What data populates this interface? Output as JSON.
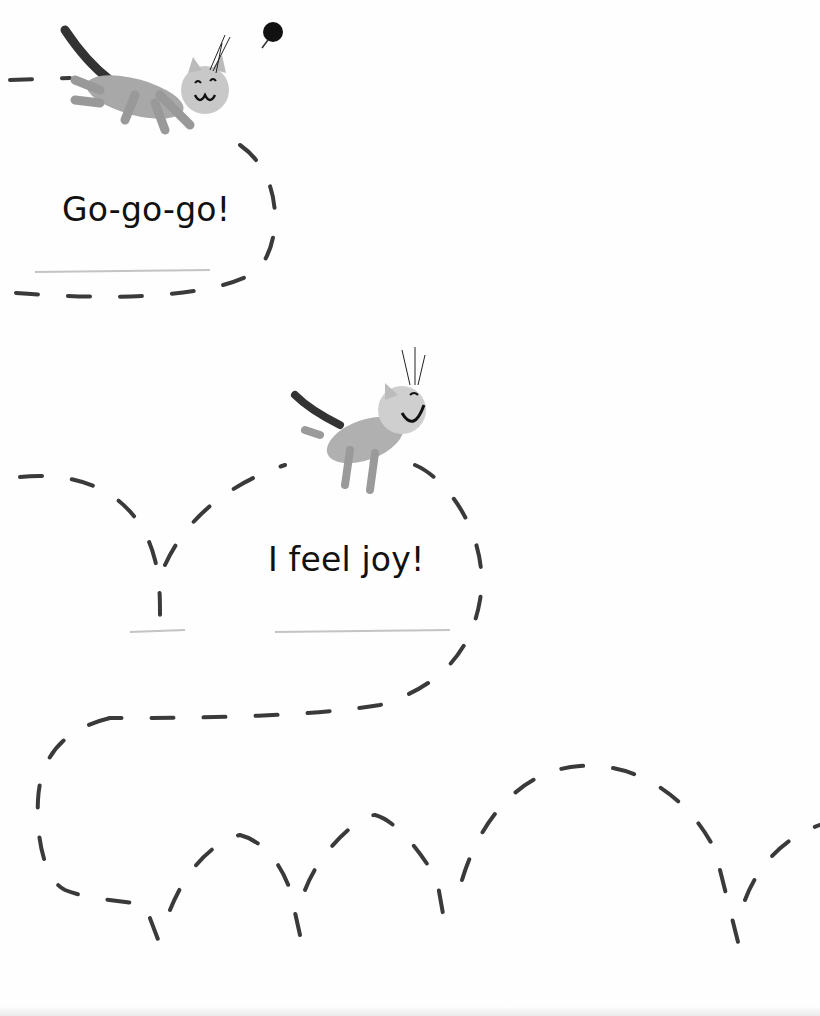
{
  "page": {
    "captions": [
      {
        "text": "Go-go-go!"
      },
      {
        "text": "I feel joy!"
      }
    ],
    "illustrations": [
      {
        "subject": "tabby-cat-leaping",
        "mood": "happy"
      },
      {
        "subject": "tabby-cat-flying",
        "mood": "laughing"
      },
      {
        "subject": "ball"
      }
    ],
    "colors": {
      "ink": "#1a1a1a",
      "dash": "#3a3a3a",
      "cat_fur": "#9a9a9a",
      "background": "#fefefe"
    }
  }
}
